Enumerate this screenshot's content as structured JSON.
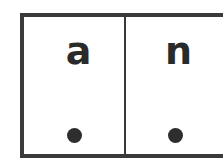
{
  "cards": [
    {
      "letter": "a",
      "marker": "dot"
    },
    {
      "letter": "n",
      "marker": "dot"
    }
  ],
  "colors": {
    "border": "#3a3a3a",
    "text": "#2a2a2a",
    "dot": "#2e2e2e",
    "background": "#ffffff"
  }
}
